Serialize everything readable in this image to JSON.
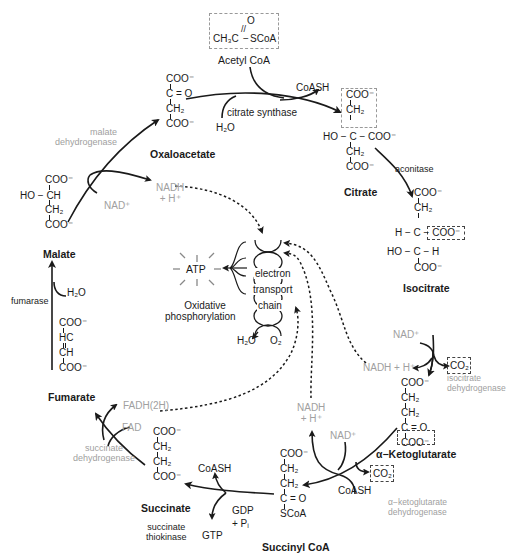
{
  "diagram": {
    "colors": {
      "primary_text": "#1a1a1a",
      "enzyme_grey": "#a0a0a0",
      "arrow": "#1a1a1a"
    },
    "acetyl_coa": {
      "formula_left": "CH₃C",
      "formula_right": "SCoA",
      "oxygen": "O",
      "name": "Acetyl CoA"
    },
    "citrate_synthase": {
      "enzyme": "citrate synthase",
      "input": "H₂O",
      "output": "CoASH"
    },
    "oxaloacetate": {
      "lines": [
        "COO⁻",
        "C = O",
        "CH₂",
        "COO⁻"
      ],
      "name": "Oxaloacetate"
    },
    "citrate": {
      "lines": [
        "COO⁻",
        "CH₂",
        "HO − C − COO⁻",
        "CH₂",
        "COO⁻"
      ],
      "name": "Citrate"
    },
    "aconitase": {
      "enzyme": "aconitase"
    },
    "isocitrate": {
      "lines": [
        "COO⁻",
        "CH₂",
        "H − C − COO⁻",
        "HO − C − H",
        "COO⁻"
      ],
      "name": "Isocitrate"
    },
    "isocitrate_dehydrogenase": {
      "enzyme_line1": "isocitrate",
      "enzyme_line2": "dehydrogenase",
      "input": "NAD⁺",
      "output_nadh": "NADH + H⁺",
      "output_co2": "CO₂"
    },
    "alpha_ketoglutarate": {
      "lines": [
        "COO⁻",
        "CH₂",
        "CH₂",
        "C = O",
        "COO⁻"
      ],
      "name": "α−Ketoglutarate"
    },
    "akg_dehydrogenase": {
      "enzyme_line1": "α−ketoglutarate",
      "enzyme_line2": "dehydrogenase",
      "input_nad": "NAD⁺",
      "input_coash": "CoASH",
      "output_nadh_1": "NADH",
      "output_nadh_2": "+ H⁺",
      "output_co2": "CO₂"
    },
    "succinyl_coa": {
      "lines": [
        "COO⁻",
        "CH₂",
        "CH₂",
        "C = O",
        "SCoA"
      ],
      "name": "Succinyl CoA"
    },
    "succinate_thiokinase": {
      "enzyme_line1": "succinate",
      "enzyme_line2": "thiokinase",
      "input_1": "GDP",
      "input_2": "+ Pᵢ",
      "output_gtp": "GTP",
      "output_coash": "CoASH"
    },
    "succinate": {
      "lines": [
        "COO⁻",
        "CH₂",
        "CH₂",
        "COO⁻"
      ],
      "name": "Succinate"
    },
    "succinate_dehydrogenase": {
      "enzyme_line1": "succinate",
      "enzyme_line2": "dehydrogenase",
      "input": "FAD",
      "output": "FADH(2H)"
    },
    "fumarate": {
      "lines": [
        "COO⁻",
        "HC",
        "CH",
        "COO⁻"
      ],
      "name": "Fumarate"
    },
    "fumarase": {
      "enzyme": "fumarase",
      "input": "H₂O"
    },
    "malate": {
      "lines": [
        "COO⁻",
        "HO − CH",
        "CH₂",
        "COO⁻"
      ],
      "name": "Malate"
    },
    "malate_dehydrogenase": {
      "enzyme_line1": "malate",
      "enzyme_line2": "dehydrogenase",
      "input": "NAD⁺",
      "output_1": "NADH",
      "output_2": "+ H⁺"
    },
    "etc": {
      "label_1": "electron",
      "label_2": "transport",
      "label_3": "chain",
      "product_h2o": "H₂O",
      "input_o2": "O₂",
      "atp": "ATP",
      "oxphos_1": "Oxidative",
      "oxphos_2": "phosphorylation"
    }
  }
}
